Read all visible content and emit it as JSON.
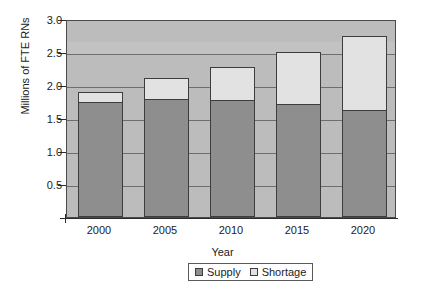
{
  "chart_data": {
    "type": "bar",
    "stacked": true,
    "title": "",
    "xlabel": "Year",
    "ylabel": "Millions of FTE RNs",
    "categories": [
      "2000",
      "2005",
      "2010",
      "2015",
      "2020"
    ],
    "series": [
      {
        "name": "Supply",
        "values": [
          1.75,
          1.79,
          1.78,
          1.71,
          1.62
        ]
      },
      {
        "name": "Shortage",
        "values": [
          0.15,
          0.31,
          0.5,
          0.79,
          1.12
        ]
      }
    ],
    "totals": [
      1.9,
      2.1,
      2.28,
      2.5,
      2.74
    ],
    "ylim": [
      0,
      3.0
    ],
    "ytick_labels": [
      "3.0",
      "2.5",
      "2.0",
      "1.5",
      "1.0",
      "0.5"
    ],
    "ytick_values": [
      3.0,
      2.5,
      2.0,
      1.5,
      1.0,
      0.5
    ],
    "gridlines": true,
    "legend_position": "bottom",
    "colors": {
      "supply": "#8e8e8e",
      "shortage": "#e2e2e2",
      "plot_background": "#bcbcbc",
      "gridline": "#6e6e6e",
      "axis": "#2b2b2b",
      "bar_outline": "#3d3d3d"
    }
  },
  "axes": {
    "y_title": "Millions of FTE RNs",
    "x_title": "Year"
  },
  "legend": {
    "items": [
      {
        "label": "Supply",
        "color": "#8e8e8e"
      },
      {
        "label": "Shortage",
        "color": "#e2e2e2"
      }
    ]
  }
}
